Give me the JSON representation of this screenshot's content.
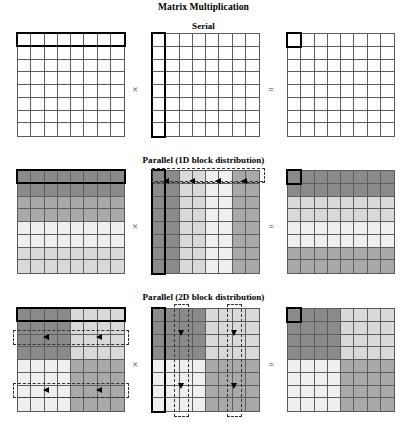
{
  "figure": {
    "title": "Matrix Multiplication",
    "sections": [
      {
        "id": "serial",
        "label": "Serial"
      },
      {
        "id": "block1d",
        "label": "Parallel (1D block distribution)"
      },
      {
        "id": "block2d",
        "label": "Parallel (2D block distribution)"
      }
    ],
    "operators": {
      "times": "×",
      "equals": "="
    },
    "grid": {
      "rows": 8,
      "cols": 8
    },
    "colors": {
      "white": "#ffffff",
      "dark_gray": "#8a8a8a",
      "mid_gray": "#a9a9a9",
      "light_gray": "#d9d9d9",
      "xlight_gray": "#efefef",
      "grid_line": "#5e5e5e",
      "highlight_outline": "#000000",
      "dashed_outline": "#333333"
    }
  },
  "serial": {
    "operand_a": {
      "name": "matrix-a",
      "shading": "all-white",
      "highlight": "row-0-full-width"
    },
    "operand_b": {
      "name": "matrix-b",
      "shading": "all-white",
      "highlight": "column-0-full-height"
    },
    "result": {
      "name": "matrix-c",
      "shading": "all-white",
      "highlight": "cell-0-0"
    }
  },
  "block1d": {
    "operand_a": {
      "name": "matrix-a",
      "shading": "row-bands",
      "row_band_tones": [
        "dark_gray",
        "dark_gray",
        "mid_gray",
        "mid_gray",
        "xlight_gray",
        "xlight_gray",
        "light_gray",
        "light_gray"
      ],
      "highlight": "row-0-full-width"
    },
    "operand_b": {
      "name": "matrix-b",
      "shading": "column-bands",
      "col_band_tones": [
        "dark_gray",
        "dark_gray",
        "light_gray",
        "light_gray",
        "xlight_gray",
        "xlight_gray",
        "mid_gray",
        "mid_gray"
      ],
      "highlight": "column-0-full-height",
      "broadcast": {
        "type": "horizontal-dashed-arrows",
        "direction": "left",
        "arrow_count": 4,
        "dashed_box": "spans-full-width-top"
      }
    },
    "result": {
      "name": "matrix-c",
      "shading": "row-bands",
      "row_band_tones": [
        "dark_gray",
        "dark_gray",
        "light_gray",
        "light_gray",
        "xlight_gray",
        "xlight_gray",
        "mid_gray",
        "mid_gray"
      ],
      "highlight": "cell-0-0"
    }
  },
  "block2d": {
    "operand_a": {
      "name": "matrix-a",
      "shading": "quadrants",
      "quadrant_tones": {
        "top_left": "dark_gray",
        "top_right": "light_gray",
        "bottom_left": "xlight_gray",
        "bottom_right": "mid_gray"
      },
      "highlight": "row-0-full-width",
      "broadcast": {
        "type": "horizontal-dashed-arrows",
        "direction": "left",
        "arrow_count": 4,
        "dashed_box_count": 2
      }
    },
    "operand_b": {
      "name": "matrix-b",
      "shading": "quadrants",
      "quadrant_tones": {
        "top_left": "dark_gray",
        "top_right": "light_gray",
        "bottom_left": "xlight_gray",
        "bottom_right": "mid_gray"
      },
      "highlight": "column-0-full-height",
      "broadcast": {
        "type": "vertical-dashed-arrows",
        "direction": "down",
        "arrow_count": 4,
        "dashed_box_count": 2
      }
    },
    "result": {
      "name": "matrix-c",
      "shading": "quadrants",
      "quadrant_tones": {
        "top_left": "dark_gray",
        "top_right": "light_gray",
        "bottom_left": "xlight_gray",
        "bottom_right": "mid_gray"
      },
      "highlight": "cell-0-0"
    }
  }
}
